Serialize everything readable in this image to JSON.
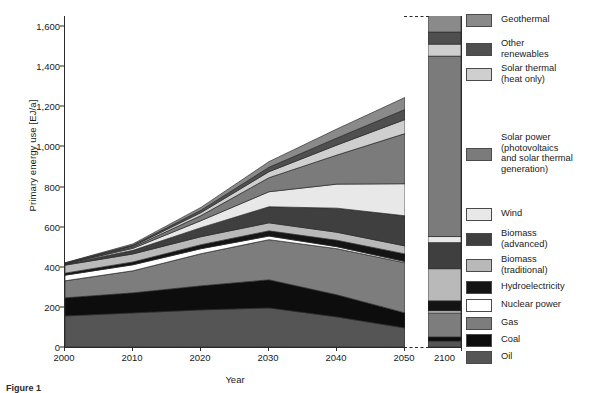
{
  "axes": {
    "ylabel": "Primary energy use [EJ/a]",
    "xlabel": "Year",
    "yticks": [
      "0",
      "200",
      "400",
      "600",
      "800",
      "1,000",
      "1,200",
      "1,400",
      "1,600"
    ],
    "xticks": [
      "2000",
      "2010",
      "2020",
      "2030",
      "2040",
      "2050"
    ],
    "xtick_break": "2100"
  },
  "caption": "Figure 1",
  "legend": [
    {
      "label": "Geothermal",
      "color": "#8a8a8a"
    },
    {
      "label": "Other\nrenewables",
      "color": "#4f4f4f"
    },
    {
      "label": "Solar thermal\n(heat only)",
      "color": "#cfcfcf"
    },
    {
      "label": "Solar power\n(photovoltaics\nand solar thermal\ngeneration)",
      "color": "#7b7b7b"
    },
    {
      "label": "Wind",
      "color": "#e8e8e8"
    },
    {
      "label": "Biomass\n(advanced)",
      "color": "#3f3f3f"
    },
    {
      "label": "Biomass\n(traditional)",
      "color": "#b9b9b9"
    },
    {
      "label": "Hydroelectricity",
      "color": "#141414"
    },
    {
      "label": "Nuclear power",
      "color": "#ffffff"
    },
    {
      "label": "Gas",
      "color": "#7d7d7d"
    },
    {
      "label": "Coal",
      "color": "#0d0d0d"
    },
    {
      "label": "Oil",
      "color": "#555555"
    }
  ],
  "chart_data": {
    "type": "area",
    "title": "",
    "xlabel": "Year",
    "ylabel": "Primary energy use [EJ/a]",
    "ylim": [
      0,
      1650
    ],
    "grid": false,
    "legend_position": "right",
    "x": [
      2000,
      2010,
      2020,
      2030,
      2040,
      2050
    ],
    "x_break_panel": [
      2100
    ],
    "stack_order_bottom_to_top": [
      "Oil",
      "Coal",
      "Gas",
      "Nuclear power",
      "Hydroelectricity",
      "Biomass (traditional)",
      "Biomass (advanced)",
      "Wind",
      "Solar power (photovoltaics and solar thermal generation)",
      "Solar thermal (heat only)",
      "Other renewables",
      "Geothermal"
    ],
    "series": [
      {
        "name": "Oil",
        "color": "#555555",
        "values": [
          155,
          170,
          185,
          195,
          150,
          95
        ],
        "value_2100": 30
      },
      {
        "name": "Coal",
        "color": "#0d0d0d",
        "values": [
          90,
          100,
          120,
          140,
          110,
          75
        ],
        "value_2100": 20
      },
      {
        "name": "Gas",
        "color": "#7d7d7d",
        "values": [
          85,
          110,
          160,
          200,
          230,
          250
        ],
        "value_2100": 120
      },
      {
        "name": "Nuclear power",
        "color": "#ffffff",
        "values": [
          28,
          30,
          25,
          18,
          10,
          6
        ],
        "value_2100": 10
      },
      {
        "name": "Hydroelectricity",
        "color": "#141414",
        "values": [
          10,
          14,
          20,
          26,
          32,
          38
        ],
        "value_2100": 50
      },
      {
        "name": "Biomass (traditional)",
        "color": "#b9b9b9",
        "values": [
          40,
          40,
          40,
          40,
          40,
          40
        ],
        "value_2100": 160
      },
      {
        "name": "Biomass (advanced)",
        "color": "#3f3f3f",
        "values": [
          5,
          18,
          45,
          80,
          120,
          150
        ],
        "value_2100": 130
      },
      {
        "name": "Wind",
        "color": "#e8e8e8",
        "values": [
          1,
          10,
          35,
          75,
          120,
          160
        ],
        "value_2100": 30
      },
      {
        "name": "Solar power (photovoltaics and solar thermal generation)",
        "color": "#7b7b7b",
        "values": [
          1,
          6,
          25,
          70,
          145,
          250
        ],
        "value_2100": 900
      },
      {
        "name": "Solar thermal (heat only)",
        "color": "#cfcfcf",
        "values": [
          1,
          5,
          15,
          30,
          50,
          70
        ],
        "value_2100": 60
      },
      {
        "name": "Other renewables",
        "color": "#4f4f4f",
        "values": [
          2,
          5,
          12,
          22,
          35,
          50
        ],
        "value_2100": 60
      },
      {
        "name": "Geothermal",
        "color": "#8a8a8a",
        "values": [
          2,
          6,
          14,
          28,
          45,
          60
        ],
        "value_2100": 90
      }
    ],
    "totals": [
      420,
      514,
      696,
      924,
      1087,
      1244
    ],
    "total_2100": 1660
  }
}
